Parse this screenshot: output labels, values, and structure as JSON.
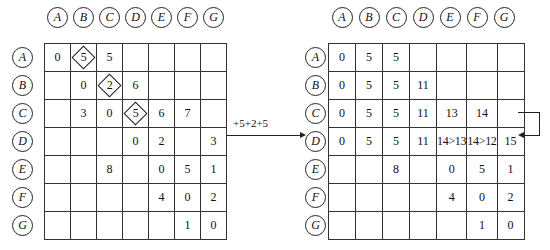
{
  "headers": [
    "A",
    "B",
    "C",
    "D",
    "E",
    "F",
    "G"
  ],
  "left_table": {
    "rows": [
      [
        "0",
        "5",
        "5",
        "",
        "",
        "",
        ""
      ],
      [
        "",
        "0",
        "2",
        "6",
        "",
        "",
        ""
      ],
      [
        "",
        "3",
        "0",
        "5",
        "6",
        "7",
        ""
      ],
      [
        "",
        "",
        "",
        "0",
        "2",
        "",
        "3"
      ],
      [
        "",
        "",
        "8",
        "",
        "0",
        "5",
        "1"
      ],
      [
        "",
        "",
        "",
        "",
        "4",
        "0",
        "2"
      ],
      [
        "",
        "",
        "",
        "",
        "",
        "1",
        "0"
      ]
    ],
    "diamonds": [
      [
        0,
        1
      ],
      [
        1,
        2
      ],
      [
        2,
        3
      ]
    ]
  },
  "arrow_label": "+5+2+5",
  "right_table": {
    "rows": [
      [
        "0",
        "5",
        "5",
        "",
        "",
        "",
        ""
      ],
      [
        "0",
        "5",
        "5",
        "11",
        "",
        "",
        ""
      ],
      [
        "0",
        "5",
        "5",
        "11",
        "13",
        "14",
        ""
      ],
      [
        "0",
        "5",
        "5",
        "11",
        "14>13",
        "14>12",
        "15"
      ],
      [
        "",
        "",
        "8",
        "",
        "0",
        "5",
        "1"
      ],
      [
        "",
        "",
        "",
        "",
        "4",
        "0",
        "2"
      ],
      [
        "",
        "",
        "",
        "",
        "",
        "1",
        "0"
      ]
    ]
  }
}
